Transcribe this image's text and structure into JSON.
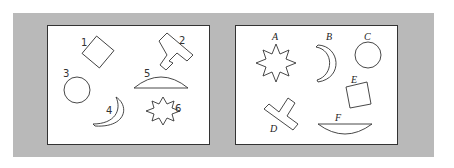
{
  "figure": {
    "left_panel": {
      "labels": [
        "1",
        "2",
        "3",
        "4",
        "5",
        "6"
      ],
      "shapes": {
        "1": "diamond",
        "2": "t-shape",
        "3": "circle",
        "4": "crescent",
        "5": "arc-segment",
        "6": "eight-point-star"
      }
    },
    "right_panel": {
      "labels": [
        "A",
        "B",
        "C",
        "D",
        "E",
        "F"
      ],
      "shapes": {
        "A": "eight-point-star",
        "B": "crescent",
        "C": "circle",
        "D": "t-shape",
        "E": "square",
        "F": "arc-segment"
      }
    }
  }
}
